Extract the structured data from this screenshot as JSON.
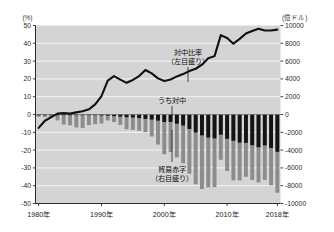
{
  "chart_data": {
    "type": "bar",
    "title": "",
    "subtitle": "",
    "xlabel": "",
    "ylabel": "(%)",
    "y2label": "(億ドル)",
    "grid": true,
    "legend_position": "inline-annotations",
    "x": [
      1980,
      1981,
      1982,
      1983,
      1984,
      1985,
      1986,
      1987,
      1988,
      1989,
      1990,
      1991,
      1992,
      1993,
      1994,
      1995,
      1996,
      1997,
      1998,
      1999,
      2000,
      2001,
      2002,
      2003,
      2004,
      2005,
      2006,
      2007,
      2008,
      2009,
      2010,
      2011,
      2012,
      2013,
      2014,
      2015,
      2016,
      2017,
      2018
    ],
    "xtick_labels": [
      "1980年",
      "1990年",
      "2000年",
      "2010年",
      "2018年"
    ],
    "xtick_values": [
      1980,
      1990,
      2000,
      2010,
      2018
    ],
    "ylim": [
      -50,
      50
    ],
    "ytick_labels": [
      "50",
      "40",
      "30",
      "20",
      "10",
      "0",
      "-10",
      "-20",
      "-30",
      "-40",
      "-50"
    ],
    "ytick_values": [
      50,
      40,
      30,
      20,
      10,
      0,
      -10,
      -20,
      -30,
      -40,
      -50
    ],
    "y2lim": [
      -10000,
      10000
    ],
    "y2tick_labels": [
      "10000",
      "8000",
      "6000",
      "4000",
      "2000",
      "0",
      "-2000",
      "-4000",
      "-6000",
      "-8000",
      "-10000"
    ],
    "y2tick_values": [
      10000,
      8000,
      6000,
      4000,
      2000,
      0,
      -2000,
      -4000,
      -6000,
      -8000,
      -10000
    ],
    "series": [
      {
        "name": "貿易赤字（右目盛り）",
        "type": "bar",
        "axis": "right",
        "unit": "億ドル",
        "color": "#8c8c8c",
        "values": [
          -255,
          -280,
          -365,
          -670,
          -1125,
          -1222,
          -1452,
          -1523,
          -1189,
          -1093,
          -1012,
          -668,
          -845,
          -1163,
          -1655,
          -1740,
          -1830,
          -1984,
          -2465,
          -3376,
          -4465,
          -4223,
          -4821,
          -5471,
          -6650,
          -7838,
          -8370,
          -8190,
          -8165,
          -5090,
          -6350,
          -7410,
          -7410,
          -7000,
          -7350,
          -7620,
          -7350,
          -7960,
          -8790
        ]
      },
      {
        "name": "うち対中",
        "type": "bar",
        "axis": "right",
        "unit": "億ドル",
        "color": "#141414",
        "values": [
          -3,
          -3,
          -3,
          -3,
          -6,
          -6,
          -17,
          -28,
          -35,
          -62,
          -104,
          -127,
          -183,
          -228,
          -295,
          -337,
          -395,
          -497,
          -569,
          -687,
          -838,
          -831,
          -1031,
          -1241,
          -1620,
          -2016,
          -2343,
          -2585,
          -2680,
          -2270,
          -2730,
          -2952,
          -3151,
          -3187,
          -3448,
          -3672,
          -3470,
          -3756,
          -4192
        ]
      },
      {
        "name": "対中比率（左目盛り）",
        "type": "line",
        "axis": "left",
        "unit": "%",
        "color": "#111111",
        "values": [
          -7.5,
          -3.5,
          -1.5,
          0.5,
          0.8,
          0.5,
          1.2,
          1.8,
          2.9,
          5.7,
          10.3,
          19.0,
          21.6,
          19.6,
          17.8,
          19.4,
          21.6,
          25.0,
          23.1,
          20.3,
          18.8,
          19.7,
          21.4,
          22.7,
          24.4,
          25.7,
          28.0,
          31.6,
          32.8,
          44.6,
          43.0,
          39.8,
          42.5,
          45.5,
          46.9,
          48.2,
          47.2,
          47.2,
          47.7
        ]
      }
    ],
    "annotations": [
      {
        "id": "line-annotation",
        "text_line1": "対中比率",
        "text_line2": "（左目盛り）",
        "leader": true
      },
      {
        "id": "china-bar-annotation",
        "text_line1": "うち対中",
        "text_line2": "",
        "leader": true
      },
      {
        "id": "deficit-bar-annotation",
        "text_line1": "貿易赤字",
        "text_line2": "（右目盛り）",
        "leader": true
      }
    ],
    "colors": {
      "plot_background": "#d4d4d4",
      "gridline": "#f4f4f4",
      "axis": "#2a2a2a",
      "bar_total": "#8c8c8c",
      "bar_china": "#141414",
      "line": "#111111"
    }
  },
  "axes": {
    "left_unit": "(%)",
    "right_unit": "(億ドル)"
  }
}
